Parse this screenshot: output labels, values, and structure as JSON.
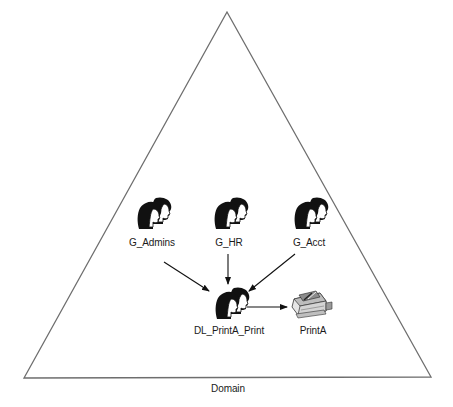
{
  "diagram": {
    "domain_label": "Domain",
    "colors": {
      "line": "#6e6e6e",
      "ink": "#111111",
      "background": "#ffffff"
    },
    "triangle": {
      "apex": [
        227,
        12
      ],
      "bottom_left": [
        24,
        378
      ],
      "bottom_right": [
        431,
        377
      ]
    },
    "nodes": [
      {
        "id": "g_admins",
        "label": "G_Admins",
        "icon": "group-users-icon",
        "x": 150,
        "y": 204
      },
      {
        "id": "g_hr",
        "label": "G_HR",
        "icon": "group-users-icon",
        "x": 227,
        "y": 204
      },
      {
        "id": "g_acct",
        "label": "G_Acct",
        "icon": "group-users-icon",
        "x": 307,
        "y": 204
      },
      {
        "id": "dl_printa_print",
        "label": "DL_PrintA_Print",
        "icon": "group-users-icon",
        "x": 227,
        "y": 293
      },
      {
        "id": "printa",
        "label": "PrintA",
        "icon": "printer-icon",
        "x": 312,
        "y": 293
      }
    ],
    "edges": [
      {
        "from": "G_Admins",
        "to": "DL_PrintA_Print"
      },
      {
        "from": "G_HR",
        "to": "DL_PrintA_Print"
      },
      {
        "from": "G_Acct",
        "to": "DL_PrintA_Print"
      },
      {
        "from": "DL_PrintA_Print",
        "to": "PrintA"
      }
    ]
  }
}
